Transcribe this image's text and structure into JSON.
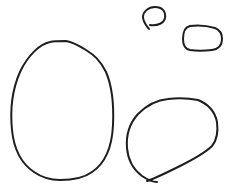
{
  "canvas": {
    "width": 230,
    "height": 192,
    "background": "#ffffff",
    "stroke_color": "#1e1e1e",
    "stroke_width": 2
  },
  "shapes": [
    {
      "name": "large-oval",
      "label": "large oval loop"
    },
    {
      "name": "small-loop",
      "label": "small loop with tail"
    },
    {
      "name": "rounded-rect",
      "label": "rounded rectangle loop"
    },
    {
      "name": "medium-loop",
      "label": "medium loop with crossing"
    }
  ]
}
